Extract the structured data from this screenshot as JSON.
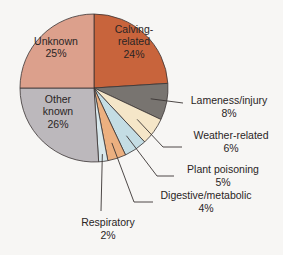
{
  "chart_data": {
    "type": "pie",
    "title": "",
    "start_angle_deg": 0,
    "direction": "clockwise",
    "slices": [
      {
        "label": "Calving-related",
        "lines": [
          "Calving-",
          "related"
        ],
        "pct": "24%",
        "value": 24,
        "color": "#c8643c",
        "label_pos": "inside"
      },
      {
        "label": "Lameness/injury",
        "lines": [
          "Lameness/injury"
        ],
        "pct": "8%",
        "value": 8,
        "color": "#787470",
        "label_pos": "outside"
      },
      {
        "label": "Weather-related",
        "lines": [
          "Weather-related"
        ],
        "pct": "6%",
        "value": 6,
        "color": "#f5e6c8",
        "label_pos": "outside"
      },
      {
        "label": "Plant poisoning",
        "lines": [
          "Plant poisoning"
        ],
        "pct": "5%",
        "value": 5,
        "color": "#c4dde4",
        "label_pos": "outside"
      },
      {
        "label": "Digestive/metabolic",
        "lines": [
          "Digestive/metabolic"
        ],
        "pct": "4%",
        "value": 4,
        "color": "#ecb080",
        "label_pos": "outside"
      },
      {
        "label": "Respiratory",
        "lines": [
          "Respiratory"
        ],
        "pct": "2%",
        "value": 2,
        "color": "#d8e8ec",
        "label_pos": "outside"
      },
      {
        "label": "Other known",
        "lines": [
          "Other",
          "known"
        ],
        "pct": "26%",
        "value": 26,
        "color": "#bcb8bc",
        "label_pos": "inside"
      },
      {
        "label": "Unknown",
        "lines": [
          "Unknown"
        ],
        "pct": "25%",
        "value": 25,
        "color": "#dca08c",
        "label_pos": "inside"
      }
    ]
  },
  "layout": {
    "cx": 94,
    "cy": 88,
    "r": 74,
    "inside_labels": [
      {
        "x": 134,
        "y": 41
      },
      null,
      null,
      null,
      null,
      null,
      {
        "x": 58,
        "y": 111
      },
      {
        "x": 56,
        "y": 47
      }
    ],
    "outside_labels": [
      null,
      {
        "anchor_r": 0.78,
        "elbow": [
          183,
          103
        ],
        "end": [
          183,
          103
        ],
        "text_x": 229,
        "text_y": 104
      },
      {
        "anchor_r": 0.72,
        "elbow": [
          163,
          147
        ],
        "end": [
          182,
          147
        ],
        "text_x": 231,
        "text_y": 139
      },
      {
        "anchor_r": 0.78,
        "elbow": [
          157,
          176
        ],
        "end": [
          174,
          176
        ],
        "text_x": 223,
        "text_y": 173
      },
      {
        "anchor_r": 0.78,
        "elbow": [
          134,
          202
        ],
        "end": [
          153,
          202
        ],
        "text_x": 206,
        "text_y": 199
      },
      {
        "anchor_r": 0.9,
        "elbow": [
          101,
          211
        ],
        "end": [
          101,
          211
        ],
        "text_x": 108,
        "text_y": 226
      }
    ]
  }
}
